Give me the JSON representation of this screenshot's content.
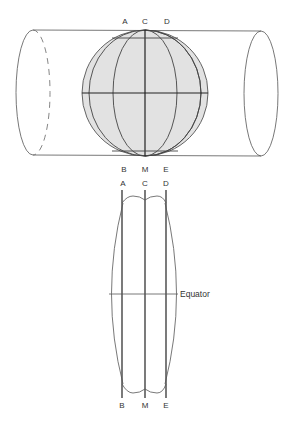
{
  "colors": {
    "globe_fill": "#e2e2e2",
    "stroke": "#444444",
    "text": "#333333"
  },
  "cylinder_figure": {
    "labels_top": [
      "A",
      "C",
      "D"
    ],
    "labels_bottom": [
      "B",
      "M",
      "E"
    ]
  },
  "gore_figure": {
    "labels_top": [
      "A",
      "C",
      "D"
    ],
    "labels_bottom": [
      "B",
      "M",
      "E"
    ],
    "equator_label": "Equator"
  }
}
